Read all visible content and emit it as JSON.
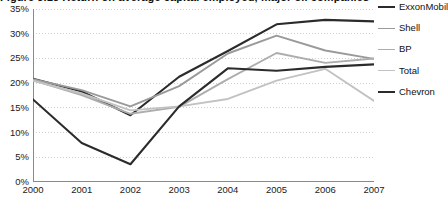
{
  "chart_data": {
    "type": "line",
    "title": "Figure 3.13    Return on average capital employed, major oil companies",
    "xlabel": "",
    "ylabel": "",
    "x": [
      2000,
      2001,
      2002,
      2003,
      2004,
      2005,
      2006,
      2007
    ],
    "categories": [
      "2000",
      "2001",
      "2002",
      "2003",
      "2004",
      "2005",
      "2006",
      "2007"
    ],
    "ylim": [
      0,
      35
    ],
    "yticks": [
      0,
      5,
      10,
      15,
      20,
      25,
      30,
      35
    ],
    "ytick_labels": [
      "0%",
      "5%",
      "10%",
      "15%",
      "20%",
      "25%",
      "30%",
      "35%"
    ],
    "value_suffix": "%",
    "grid": "horizontal-dotted",
    "legend_position": "right",
    "series": [
      {
        "name": "ExxonMobil",
        "color": "#2b2b2b",
        "width": 2.1,
        "values": [
          20.9,
          18.3,
          13.5,
          21.3,
          26.5,
          31.9,
          32.8,
          32.5
        ]
      },
      {
        "name": "Shell",
        "color": "#9a9a9a",
        "width": 1.9,
        "values": [
          20.8,
          18.6,
          15.3,
          19.4,
          26.0,
          29.6,
          26.6,
          24.9
        ]
      },
      {
        "name": "BP",
        "color": "#adadad",
        "width": 1.9,
        "values": [
          20.6,
          17.6,
          13.8,
          15.2,
          20.8,
          26.1,
          24.1,
          25.0
        ]
      },
      {
        "name": "Total",
        "color": "#c2c2c2",
        "width": 1.9,
        "values": [
          20.5,
          17.9,
          14.5,
          15.3,
          16.8,
          20.5,
          22.9,
          16.4
        ]
      },
      {
        "name": "Chevron",
        "color": "#2b2b2b",
        "width": 2.1,
        "values": [
          16.7,
          7.9,
          3.6,
          15.3,
          23.0,
          22.5,
          23.3,
          23.8
        ]
      }
    ]
  },
  "axis": {
    "line_color": "#8a8a8a",
    "grid_color": "#cfcfcf"
  }
}
